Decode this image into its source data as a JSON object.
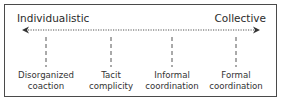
{
  "diagram": {
    "type": "spectrum",
    "axis": {
      "left_label": "Individualistic",
      "right_label": "Collective",
      "style": "dotted double-headed arrow",
      "color": "#555555"
    },
    "stages": [
      {
        "line1": "Disorganized",
        "line2": "coaction",
        "x": 46
      },
      {
        "line1": "Tacit",
        "line2": "complicity",
        "x": 111
      },
      {
        "line1": "Informal",
        "line2": "coordination",
        "x": 172
      },
      {
        "line1": "Formal",
        "line2": "coordination",
        "x": 236
      }
    ],
    "colors": {
      "border": "#4a4a4a",
      "text": "#2b2b2b",
      "background": "#ffffff"
    }
  }
}
